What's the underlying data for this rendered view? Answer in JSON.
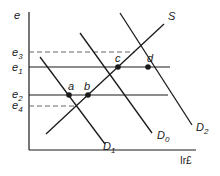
{
  "diagram": {
    "type": "supply-demand exchange rate diagram",
    "axes": {
      "y_label": "e",
      "x_label": "Ir£"
    },
    "levels": [
      {
        "id": "e3",
        "base": "e",
        "sub": "3",
        "style": "dashed"
      },
      {
        "id": "e1",
        "base": "e",
        "sub": "1",
        "style": "solid"
      },
      {
        "id": "e2",
        "base": "e",
        "sub": "2",
        "style": "solid"
      },
      {
        "id": "e4",
        "base": "e",
        "sub": "4",
        "style": "dashed"
      }
    ],
    "curves": [
      {
        "id": "S",
        "base": "S",
        "sub": ""
      },
      {
        "id": "D1",
        "base": "D",
        "sub": "1"
      },
      {
        "id": "D0",
        "base": "D",
        "sub": "0"
      },
      {
        "id": "D2",
        "base": "D",
        "sub": "2"
      }
    ],
    "points": [
      {
        "id": "a",
        "label": "a"
      },
      {
        "id": "b",
        "label": "b"
      },
      {
        "id": "c",
        "label": "c"
      },
      {
        "id": "d",
        "label": "d"
      }
    ],
    "colors": {
      "line": "#1a1a1a",
      "dashed": "#666666",
      "background": "#ffffff"
    }
  }
}
